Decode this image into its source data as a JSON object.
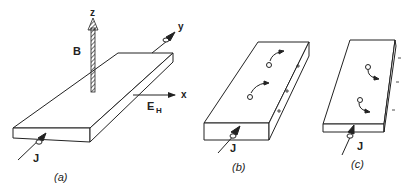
{
  "figure": {
    "panels": [
      {
        "id": "a",
        "caption": "(a)",
        "labels": {
          "z": "z",
          "y": "y",
          "x": "x",
          "B": "B",
          "E": "E",
          "E_sub": "H",
          "J": "J"
        }
      },
      {
        "id": "b",
        "caption": "(b)",
        "labels": {
          "J": "J",
          "carrier": "+",
          "edge_charge": "+"
        }
      },
      {
        "id": "c",
        "caption": "(c)",
        "labels": {
          "J": "J",
          "carrier": "−",
          "edge_charge": "−"
        }
      }
    ]
  }
}
